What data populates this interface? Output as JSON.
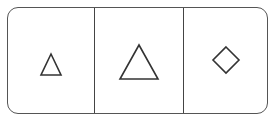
{
  "segmented_control": {
    "options": [
      {
        "label": "Small triangle",
        "icon": "triangle-small-icon"
      },
      {
        "label": "Large triangle",
        "icon": "triangle-large-icon"
      },
      {
        "label": "Diamond",
        "icon": "diamond-icon"
      }
    ],
    "stroke_color": "#333333",
    "border_color": "#555555"
  }
}
